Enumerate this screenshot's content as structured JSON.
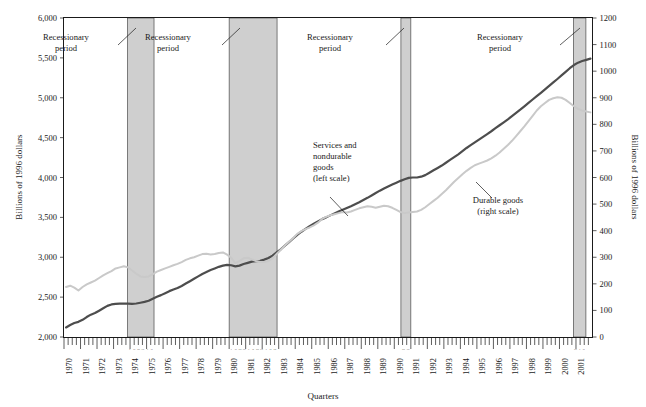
{
  "chart_data": {
    "type": "line",
    "title": "",
    "xlabel": "Quarters",
    "ylabel": "Billions of 1996 dollars",
    "ylabel_right": "Billions of 1996 dollars",
    "grid": false,
    "legend_position": "inline-annotation",
    "x_start_year": 1970,
    "x_end_year": 2001,
    "x_tick_labels": [
      "1970",
      "1971",
      "1972",
      "1973",
      "1974",
      "1975",
      "1976",
      "1977",
      "1978",
      "1979",
      "1980",
      "1981",
      "1982",
      "1983",
      "1984",
      "1985",
      "1986",
      "1987",
      "1988",
      "1989",
      "1990",
      "1991",
      "1992",
      "1993",
      "1994",
      "1995",
      "1996",
      "1997",
      "1998",
      "1999",
      "2000",
      "2001"
    ],
    "ylim_left": [
      2000,
      6000
    ],
    "y_tick_labels_left": [
      "6,000",
      "5,500",
      "5,000",
      "4,500",
      "4,000",
      "3,500",
      "3,000",
      "2,500",
      "2,000"
    ],
    "y_ticks_left": [
      6000,
      5500,
      5000,
      4500,
      4000,
      3500,
      3000,
      2500,
      2000
    ],
    "ylim_right": [
      0,
      1200
    ],
    "y_tick_labels_right": [
      "1200",
      "1100",
      "1000",
      "900",
      "800",
      "700",
      "600",
      "500",
      "400",
      "300",
      "200",
      "100",
      "0"
    ],
    "y_ticks_right": [
      1200,
      1100,
      1000,
      900,
      800,
      700,
      600,
      500,
      400,
      300,
      200,
      100,
      0
    ],
    "quarter_marks": [
      "I",
      "II",
      "III",
      "IV"
    ],
    "series": [
      {
        "name": "Services and nondurable goods",
        "scale": "left",
        "color": "#4d4d4d",
        "label_lines": [
          "Services and",
          "nondurable",
          "goods",
          "(left scale)"
        ],
        "values": [
          2120,
          2150,
          2175,
          2190,
          2215,
          2250,
          2280,
          2300,
          2330,
          2360,
          2390,
          2408,
          2415,
          2418,
          2420,
          2418,
          2415,
          2420,
          2430,
          2440,
          2455,
          2480,
          2505,
          2525,
          2550,
          2575,
          2595,
          2615,
          2640,
          2670,
          2700,
          2730,
          2760,
          2790,
          2815,
          2840,
          2860,
          2880,
          2895,
          2905,
          2900,
          2885,
          2895,
          2915,
          2930,
          2945,
          2950,
          2955,
          2970,
          2990,
          3020,
          3060,
          3100,
          3145,
          3190,
          3235,
          3280,
          3320,
          3355,
          3390,
          3420,
          3450,
          3478,
          3500,
          3525,
          3550,
          3572,
          3595,
          3618,
          3640,
          3665,
          3690,
          3718,
          3745,
          3775,
          3805,
          3835,
          3862,
          3888,
          3912,
          3935,
          3958,
          3978,
          3995,
          4000,
          4000,
          4010,
          4030,
          4060,
          4090,
          4120,
          4150,
          4185,
          4220,
          4255,
          4290,
          4330,
          4370,
          4405,
          4440,
          4475,
          4510,
          4545,
          4580,
          4618,
          4655,
          4692,
          4730,
          4770,
          4810,
          4850,
          4892,
          4935,
          4978,
          5020,
          5062,
          5105,
          5148,
          5192,
          5235,
          5280,
          5325,
          5370,
          5410,
          5440,
          5460,
          5475,
          5490
        ]
      },
      {
        "name": "Durable goods",
        "scale": "right",
        "color": "#c9c9c9",
        "label_lines": [
          "Durable goods",
          "(right scale)"
        ],
        "values": [
          188,
          193,
          186,
          175,
          188,
          198,
          205,
          212,
          222,
          232,
          240,
          248,
          258,
          262,
          266,
          262,
          250,
          238,
          228,
          226,
          228,
          236,
          246,
          252,
          258,
          264,
          270,
          275,
          282,
          290,
          296,
          300,
          306,
          312,
          313,
          310,
          312,
          316,
          318,
          310,
          298,
          278,
          286,
          296,
          298,
          292,
          286,
          282,
          282,
          286,
          296,
          312,
          328,
          344,
          358,
          372,
          388,
          398,
          406,
          412,
          420,
          430,
          444,
          452,
          458,
          462,
          466,
          470,
          468,
          472,
          478,
          484,
          488,
          492,
          490,
          486,
          490,
          494,
          492,
          486,
          478,
          470,
          466,
          468,
          470,
          472,
          478,
          488,
          500,
          512,
          524,
          538,
          552,
          568,
          584,
          598,
          612,
          625,
          636,
          646,
          652,
          658,
          664,
          672,
          682,
          694,
          708,
          722,
          738,
          756,
          774,
          792,
          812,
          832,
          852,
          868,
          880,
          892,
          898,
          902,
          900,
          892,
          880,
          868,
          858,
          852,
          848,
          845
        ]
      }
    ],
    "recession_bands": [
      {
        "label_lines": [
          "Recessionary",
          "period"
        ],
        "start_year": 1973.85,
        "end_year": 1975.45,
        "quarter_marks": "I II III IV I II"
      },
      {
        "label_lines": [
          "Recessionary",
          "period"
        ],
        "start_year": 1980.0,
        "end_year": 1982.9,
        "quarter_marks": "I II III IV I II III IV I II III"
      },
      {
        "label_lines": [
          "Recessionary",
          "period"
        ],
        "start_year": 1990.4,
        "end_year": 1991.0,
        "quarter_marks": "III IV"
      },
      {
        "label_lines": [
          "Recessionary",
          "period"
        ],
        "start_year": 2000.85,
        "end_year": 2001.6,
        "quarter_marks": "IV I II"
      }
    ],
    "annotations": [
      {
        "name": "recession-callout-1",
        "lines": [
          "Recessionary",
          "period"
        ],
        "text_x": 66,
        "text_y": 40,
        "leader": [
          [
            118,
            45
          ],
          [
            136,
            28
          ]
        ]
      },
      {
        "name": "recession-callout-2",
        "lines": [
          "Recessionary",
          "period"
        ],
        "text_x": 168,
        "text_y": 40,
        "leader": [
          [
            222,
            45
          ],
          [
            240,
            28
          ]
        ]
      },
      {
        "name": "recession-callout-3",
        "lines": [
          "Recessionary",
          "period"
        ],
        "text_x": 330,
        "text_y": 40,
        "leader": [
          [
            386,
            45
          ],
          [
            404,
            28
          ]
        ]
      },
      {
        "name": "recession-callout-4",
        "lines": [
          "Recessionary",
          "period"
        ],
        "text_x": 500,
        "text_y": 40,
        "leader": [
          [
            560,
            45
          ],
          [
            580,
            28
          ]
        ]
      },
      {
        "name": "series-label-services",
        "lines": [
          "Services and",
          "nondurable",
          "goods",
          "(left scale)"
        ],
        "text_x": 313,
        "text_y": 148,
        "leader": [
          [
            330,
            197
          ],
          [
            348,
            216
          ]
        ]
      },
      {
        "name": "series-label-durables",
        "lines": [
          "Durable goods",
          "(right scale)"
        ],
        "text_x": 498,
        "text_y": 203,
        "leader": [
          [
            492,
            198
          ],
          [
            476,
            182
          ]
        ]
      }
    ]
  }
}
